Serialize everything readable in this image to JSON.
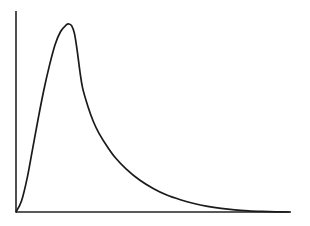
{
  "chart_data": {
    "type": "line",
    "title": "",
    "xlabel": "",
    "ylabel": "",
    "grid": false,
    "legend": null,
    "axes": {
      "origin_px": [
        16,
        212
      ],
      "x_axis_end_px": [
        291,
        212
      ],
      "y_axis_top_px": [
        16,
        11
      ]
    },
    "xlim": [
      0,
      1
    ],
    "ylim": [
      0,
      1
    ],
    "series": [
      {
        "name": "curve",
        "color": "#1a1a1a",
        "x": [
          0.0,
          0.02,
          0.04,
          0.06,
          0.08,
          0.1,
          0.12,
          0.14,
          0.16,
          0.18,
          0.19,
          0.2,
          0.21,
          0.22,
          0.23,
          0.24,
          0.26,
          0.28,
          0.3,
          0.33,
          0.36,
          0.4,
          0.45,
          0.5,
          0.55,
          0.6,
          0.65,
          0.7,
          0.75,
          0.8,
          0.85,
          0.9,
          0.95,
          1.0
        ],
        "y": [
          0.0,
          0.06,
          0.18,
          0.34,
          0.5,
          0.65,
          0.78,
          0.89,
          0.96,
          0.995,
          1.0,
          0.99,
          0.95,
          0.86,
          0.75,
          0.66,
          0.56,
          0.48,
          0.42,
          0.35,
          0.29,
          0.23,
          0.17,
          0.125,
          0.09,
          0.065,
          0.045,
          0.03,
          0.019,
          0.011,
          0.006,
          0.003,
          0.001,
          0.0
        ]
      }
    ]
  }
}
